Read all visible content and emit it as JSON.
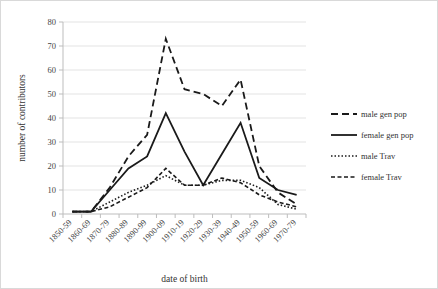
{
  "chart_data": {
    "type": "line",
    "title": "",
    "xlabel": "date of birth",
    "ylabel": "number of contributors",
    "categories": [
      "1850-59",
      "1860-69",
      "1870-79",
      "1880-89",
      "1890-99",
      "1900-09",
      "1910-19",
      "1920-29",
      "1930-39",
      "1940-49",
      "1950-59",
      "1960-69",
      "1970-79"
    ],
    "ylim": [
      0,
      80
    ],
    "yticks": [
      0,
      10,
      20,
      30,
      40,
      50,
      60,
      70,
      80
    ],
    "grid": true,
    "legend_position": "right",
    "series": [
      {
        "name": "male gen pop",
        "style": "long-dash",
        "dasharray": "7,4",
        "width": 1.8,
        "values": [
          1,
          1,
          11,
          24,
          33,
          73,
          52,
          50,
          45,
          56,
          20,
          9,
          4
        ]
      },
      {
        "name": "female gen pop",
        "style": "solid",
        "dasharray": "",
        "width": 1.8,
        "values": [
          1,
          1,
          10,
          19,
          24,
          42,
          26,
          12,
          25,
          38,
          15,
          10,
          8
        ]
      },
      {
        "name": "male Trav",
        "style": "dotted",
        "dasharray": "1.5,2",
        "width": 1.6,
        "values": [
          1,
          1,
          5,
          9,
          12,
          16,
          12,
          12,
          14,
          14,
          11,
          4,
          2
        ]
      },
      {
        "name": "female Trav",
        "style": "short-dash",
        "dasharray": "4,2.5",
        "width": 1.6,
        "values": [
          1,
          1,
          3,
          7,
          11,
          19,
          12,
          12,
          15,
          13,
          8,
          5,
          3
        ]
      }
    ]
  },
  "colors": {
    "ink": "#1a1a1a",
    "grid": "#e3e3e3",
    "axis": "#bdbdbd",
    "border": "#d9d9d9",
    "background": "#ffffff"
  }
}
